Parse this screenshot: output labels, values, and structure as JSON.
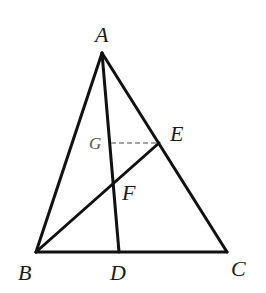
{
  "diagram": {
    "type": "geometry-triangle",
    "points": {
      "A": {
        "x": 102,
        "y": 53
      },
      "B": {
        "x": 36,
        "y": 252
      },
      "C": {
        "x": 227,
        "y": 252
      },
      "D": {
        "x": 119,
        "y": 252
      },
      "E": {
        "x": 159,
        "y": 143
      },
      "G": {
        "x": 111,
        "y": 143
      },
      "F": {
        "x": 114,
        "y": 183
      }
    },
    "segments": [
      {
        "from": "A",
        "to": "B",
        "style": "solid"
      },
      {
        "from": "A",
        "to": "C",
        "style": "solid"
      },
      {
        "from": "B",
        "to": "C",
        "style": "solid"
      },
      {
        "from": "A",
        "to": "D",
        "style": "solid"
      },
      {
        "from": "B",
        "to": "E",
        "style": "solid"
      },
      {
        "from": "G",
        "to": "E",
        "style": "dashed"
      }
    ],
    "labels": {
      "A": "A",
      "B": "B",
      "C": "C",
      "D": "D",
      "E": "E",
      "F": "F",
      "G": "G"
    },
    "colors": {
      "line": "#111111",
      "dashed": "#888888",
      "background": "#ffffff"
    }
  }
}
